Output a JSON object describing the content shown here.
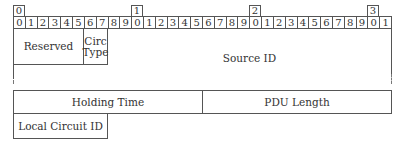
{
  "diagram": {
    "type": "packet-header",
    "bit_width": 32,
    "decade_markers": [
      "0",
      "1",
      "2",
      "3"
    ],
    "bit_labels": [
      "0",
      "1",
      "2",
      "3",
      "4",
      "5",
      "6",
      "7",
      "8",
      "9",
      "0",
      "1",
      "2",
      "3",
      "4",
      "5",
      "6",
      "7",
      "8",
      "9",
      "0",
      "1",
      "2",
      "3",
      "4",
      "5",
      "6",
      "7",
      "8",
      "9",
      "0",
      "1"
    ],
    "fields": {
      "reserved": {
        "label": "Reserved",
        "bits": "0-5"
      },
      "circ_type": {
        "label": "Circ Type",
        "line1": "Circ",
        "line2": "Type",
        "bits": "6-7"
      },
      "source_id": {
        "label": "Source ID",
        "bits": "8-..."
      },
      "holding_time": {
        "label": "Holding Time",
        "bits": "0-15"
      },
      "pdu_length": {
        "label": "PDU Length",
        "bits": "16-31"
      },
      "local_circuit_id": {
        "label": "Local Circuit ID",
        "bits": "0-7"
      }
    }
  }
}
